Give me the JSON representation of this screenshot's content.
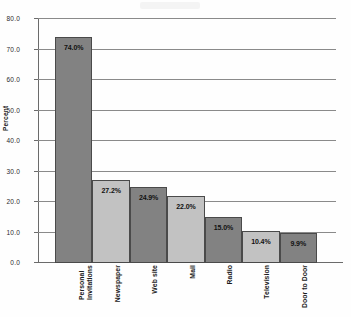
{
  "chart_data": {
    "type": "bar",
    "title": "",
    "xlabel": "",
    "ylabel": "Percent",
    "ylim": [
      0,
      80
    ],
    "ytick_step": 10,
    "grid": true,
    "legend": "none",
    "orientation": "vertical",
    "categories": [
      "Personal Invitations",
      "Newspaper",
      "Web site",
      "Mail",
      "Radio",
      "Television",
      "Door to Door"
    ],
    "category_lines": [
      [
        "Personal",
        "Invitations"
      ],
      [
        "Newspaper"
      ],
      [
        "Web site"
      ],
      [
        "Mail"
      ],
      [
        "Radio"
      ],
      [
        "Television"
      ],
      [
        "Door to Door"
      ]
    ],
    "values": [
      74.0,
      27.2,
      24.9,
      22.0,
      15.0,
      10.4,
      9.9
    ],
    "data_labels": [
      "74.0%",
      "27.2%",
      "24.9%",
      "22.0%",
      "15.0%",
      "10.4%",
      "9.9%"
    ],
    "ytick_labels": [
      "80.0",
      "70.0",
      "60.0",
      "50.0",
      "40.0",
      "30.0",
      "20.0",
      "10.0",
      "0.0"
    ],
    "ytick_values": [
      80,
      70,
      60,
      50,
      40,
      30,
      20,
      10,
      0
    ],
    "bar_shades": [
      "dark",
      "light",
      "dark",
      "light",
      "dark",
      "light",
      "dark"
    ],
    "colors": {
      "bar_dark": "#828282",
      "bar_light": "#c2c2c2",
      "bar_border": "#4a4a4a",
      "gridline": "#8a8a8a",
      "axis": "#6b6b6b",
      "text": "#1a1a1a",
      "background": "#fefefe"
    }
  }
}
